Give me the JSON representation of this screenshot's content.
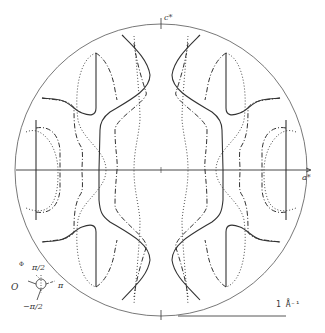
{
  "figure": {
    "type": "phase contour map in reciprocal space",
    "axes": {
      "vertical_label": "c*",
      "horizontal_label": "a*"
    },
    "scale_bar": {
      "label": "1 Å⁻¹"
    },
    "phase_legend": {
      "symbol": "Φ",
      "top": "π/2",
      "left": "O",
      "right": "π",
      "bottom": "−π/2"
    },
    "line_styles": {
      "solid": "phase 0",
      "dashed": "phase ±π/2",
      "dotted": "phase π"
    },
    "colors": {
      "background": "#ffffff",
      "ink": "#333333",
      "circle": "#555555"
    }
  }
}
